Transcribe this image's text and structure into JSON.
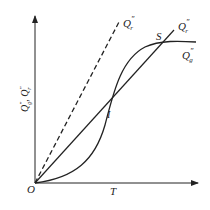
{
  "diagram": {
    "type": "heat generation vs heat removal curves",
    "axes": {
      "x_label": "T",
      "y_label": "Q''g, Q''r",
      "origin_label": "O"
    },
    "curves": [
      {
        "id": "removal_dashed",
        "label": "Q''r",
        "style": "dashed",
        "shape": "straight line from origin, steep"
      },
      {
        "id": "removal_solid",
        "label": "Q''r",
        "style": "solid",
        "shape": "straight line from origin"
      },
      {
        "id": "generation",
        "label": "Q''g",
        "style": "solid",
        "shape": "S-shaped curve"
      }
    ],
    "points": [
      {
        "label": "I",
        "description": "intersection (unstable)"
      },
      {
        "label": "S",
        "description": "intersection (stable)"
      }
    ],
    "labels": {
      "dashed_line": "Q",
      "dashed_line_sup": "″",
      "dashed_line_sub": "r",
      "solid_line": "Q",
      "solid_line_sup": "″",
      "solid_line_sub": "r",
      "curve": "Q",
      "curve_sup": "″",
      "curve_sub": "g",
      "point_s": "S",
      "point_i": "I",
      "origin": "O",
      "x_axis": "T",
      "y_axis_1": "Q",
      "y_axis_1_sup": "″",
      "y_axis_1_sub": "g",
      "y_axis_sep": ", ",
      "y_axis_2": "Q",
      "y_axis_2_sup": "″",
      "y_axis_2_sub": "r"
    },
    "colors": {
      "line": "#222222",
      "background": "#ffffff"
    }
  }
}
